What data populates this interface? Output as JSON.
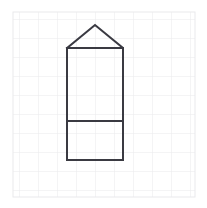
{
  "canvas": {
    "width": 207,
    "height": 208,
    "background_color": "#ffffff"
  },
  "grid": {
    "name": "graph-paper-grid",
    "x_start": 13,
    "y_start": 12,
    "x_end": 195,
    "y_end": 197,
    "cell_size": 19,
    "columns": 9,
    "rows": 9,
    "line_color": "#e9e9ec",
    "line_width": 1
  },
  "figure": {
    "name": "house-pentagon-shape",
    "stroke_color": "#3a3a42",
    "stroke_width": 2,
    "fill": "none",
    "body_rect": {
      "left": 67,
      "right": 123,
      "top": 48,
      "bottom": 160,
      "width": 56,
      "height": 112
    },
    "roof_apex": {
      "x": 95,
      "y": 25
    },
    "divider_line": {
      "x1": 67,
      "x2": 123,
      "y": 121
    },
    "outline_points": "67,48 95,25 123,48 123,160 67,160 67,48"
  }
}
